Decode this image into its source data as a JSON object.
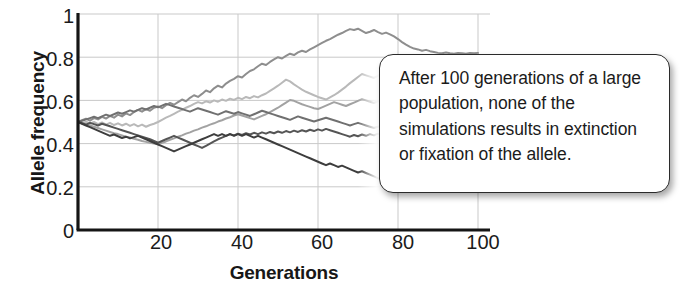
{
  "chart_data": {
    "type": "line",
    "title": "",
    "xlabel": "Generations",
    "ylabel": "Allele frequency",
    "xlim": [
      0,
      103
    ],
    "ylim": [
      0,
      1
    ],
    "xticks": [
      20,
      40,
      60,
      80,
      100
    ],
    "yticks": [
      0,
      0.2,
      0.4,
      0.6,
      0.8,
      1
    ],
    "ytick_labels": [
      "0",
      "0.2",
      "0.4",
      "0.6",
      "0.8",
      "1"
    ],
    "xtick_labels": [
      "20",
      "40",
      "60",
      "80",
      "100"
    ],
    "grid": true,
    "legend_position": "none",
    "annotation": "After 100 generations of a large population, none of the simulations results in extinction or fixation of the allele.",
    "x": [
      0,
      1,
      2,
      3,
      4,
      5,
      6,
      7,
      8,
      9,
      10,
      11,
      12,
      13,
      14,
      15,
      16,
      17,
      18,
      19,
      20,
      21,
      22,
      23,
      24,
      25,
      26,
      27,
      28,
      29,
      30,
      31,
      32,
      33,
      34,
      35,
      36,
      37,
      38,
      39,
      40,
      41,
      42,
      43,
      44,
      45,
      46,
      47,
      48,
      49,
      50,
      51,
      52,
      53,
      54,
      55,
      56,
      57,
      58,
      59,
      60,
      61,
      62,
      63,
      64,
      65,
      66,
      67,
      68,
      69,
      70,
      71,
      72,
      73,
      74,
      75,
      76,
      77,
      78,
      79,
      80,
      81,
      82,
      83,
      84,
      85,
      86,
      87,
      88,
      89,
      90,
      91,
      92,
      93,
      94,
      95,
      96,
      97,
      98,
      99,
      100
    ],
    "series": [
      {
        "name": "simulation-1",
        "color": "#8e8e8e",
        "final_value": 0.82,
        "values": [
          0.5,
          0.508,
          0.515,
          0.506,
          0.518,
          0.512,
          0.524,
          0.516,
          0.528,
          0.52,
          0.534,
          0.526,
          0.54,
          0.532,
          0.546,
          0.556,
          0.548,
          0.56,
          0.552,
          0.566,
          0.572,
          0.564,
          0.578,
          0.588,
          0.58,
          0.592,
          0.604,
          0.596,
          0.612,
          0.624,
          0.616,
          0.63,
          0.646,
          0.638,
          0.656,
          0.668,
          0.66,
          0.678,
          0.69,
          0.7,
          0.712,
          0.706,
          0.722,
          0.736,
          0.744,
          0.758,
          0.77,
          0.764,
          0.778,
          0.79,
          0.8,
          0.794,
          0.806,
          0.816,
          0.81,
          0.822,
          0.83,
          0.824,
          0.836,
          0.846,
          0.856,
          0.866,
          0.876,
          0.884,
          0.894,
          0.904,
          0.912,
          0.922,
          0.93,
          0.926,
          0.932,
          0.922,
          0.912,
          0.918,
          0.926,
          0.916,
          0.908,
          0.914,
          0.906,
          0.896,
          0.884,
          0.87,
          0.858,
          0.848,
          0.84,
          0.836,
          0.83,
          0.834,
          0.828,
          0.824,
          0.82,
          0.818,
          0.822,
          0.818,
          0.816,
          0.82,
          0.818,
          0.816,
          0.82,
          0.818,
          0.82
        ]
      },
      {
        "name": "simulation-2",
        "color": "#b9b9b9",
        "final_value": 0.66,
        "values": [
          0.5,
          0.494,
          0.502,
          0.492,
          0.5,
          0.49,
          0.498,
          0.488,
          0.496,
          0.486,
          0.494,
          0.484,
          0.492,
          0.482,
          0.49,
          0.48,
          0.488,
          0.478,
          0.486,
          0.492,
          0.5,
          0.51,
          0.52,
          0.528,
          0.538,
          0.548,
          0.556,
          0.566,
          0.574,
          0.584,
          0.592,
          0.586,
          0.596,
          0.59,
          0.6,
          0.594,
          0.604,
          0.598,
          0.608,
          0.602,
          0.612,
          0.606,
          0.616,
          0.61,
          0.62,
          0.614,
          0.624,
          0.632,
          0.644,
          0.656,
          0.668,
          0.682,
          0.696,
          0.688,
          0.674,
          0.662,
          0.65,
          0.64,
          0.632,
          0.624,
          0.616,
          0.61,
          0.604,
          0.614,
          0.624,
          0.636,
          0.65,
          0.664,
          0.68,
          0.694,
          0.708,
          0.722,
          0.716,
          0.71,
          0.704,
          0.714,
          0.726,
          0.714,
          0.7,
          0.69,
          0.68,
          0.672,
          0.664,
          0.656,
          0.65,
          0.644,
          0.652,
          0.646,
          0.64,
          0.648,
          0.642,
          0.65,
          0.644,
          0.652,
          0.646,
          0.654,
          0.648,
          0.656,
          0.65,
          0.658,
          0.66
        ]
      },
      {
        "name": "simulation-3",
        "color": "#a2a2a2",
        "final_value": 0.64,
        "values": [
          0.5,
          0.496,
          0.49,
          0.484,
          0.478,
          0.472,
          0.466,
          0.46,
          0.454,
          0.448,
          0.444,
          0.438,
          0.432,
          0.428,
          0.422,
          0.418,
          0.412,
          0.408,
          0.404,
          0.4,
          0.398,
          0.404,
          0.41,
          0.418,
          0.424,
          0.432,
          0.438,
          0.446,
          0.452,
          0.46,
          0.466,
          0.474,
          0.48,
          0.488,
          0.494,
          0.502,
          0.508,
          0.516,
          0.522,
          0.53,
          0.536,
          0.53,
          0.524,
          0.518,
          0.512,
          0.52,
          0.528,
          0.536,
          0.546,
          0.556,
          0.566,
          0.578,
          0.59,
          0.602,
          0.598,
          0.59,
          0.582,
          0.576,
          0.57,
          0.564,
          0.56,
          0.568,
          0.576,
          0.584,
          0.592,
          0.586,
          0.58,
          0.574,
          0.582,
          0.59,
          0.598,
          0.606,
          0.6,
          0.594,
          0.588,
          0.596,
          0.604,
          0.612,
          0.62,
          0.614,
          0.608,
          0.6,
          0.606,
          0.614,
          0.622,
          0.616,
          0.61,
          0.618,
          0.626,
          0.62,
          0.628,
          0.622,
          0.63,
          0.624,
          0.632,
          0.626,
          0.634,
          0.628,
          0.636,
          0.632,
          0.64
        ]
      },
      {
        "name": "simulation-4",
        "color": "#707070",
        "final_value": 0.47,
        "values": [
          0.5,
          0.506,
          0.512,
          0.518,
          0.524,
          0.518,
          0.526,
          0.534,
          0.528,
          0.536,
          0.544,
          0.538,
          0.546,
          0.554,
          0.548,
          0.556,
          0.564,
          0.558,
          0.566,
          0.574,
          0.568,
          0.576,
          0.584,
          0.578,
          0.572,
          0.566,
          0.56,
          0.554,
          0.548,
          0.556,
          0.564,
          0.558,
          0.552,
          0.546,
          0.54,
          0.534,
          0.542,
          0.55,
          0.544,
          0.538,
          0.546,
          0.54,
          0.534,
          0.528,
          0.536,
          0.544,
          0.552,
          0.546,
          0.54,
          0.534,
          0.528,
          0.522,
          0.516,
          0.51,
          0.518,
          0.526,
          0.52,
          0.514,
          0.508,
          0.502,
          0.508,
          0.514,
          0.52,
          0.514,
          0.508,
          0.502,
          0.496,
          0.49,
          0.484,
          0.49,
          0.496,
          0.49,
          0.484,
          0.478,
          0.472,
          0.478,
          0.484,
          0.478,
          0.472,
          0.466,
          0.472,
          0.466,
          0.472,
          0.468,
          0.474,
          0.47,
          0.466,
          0.472,
          0.468,
          0.474,
          0.47,
          0.466,
          0.472,
          0.468,
          0.474,
          0.47,
          0.466,
          0.472,
          0.468,
          0.47,
          0.47
        ]
      },
      {
        "name": "simulation-5",
        "color": "#555555",
        "final_value": 0.44,
        "values": [
          0.5,
          0.494,
          0.488,
          0.496,
          0.49,
          0.484,
          0.492,
          0.486,
          0.48,
          0.474,
          0.468,
          0.462,
          0.456,
          0.45,
          0.444,
          0.438,
          0.432,
          0.426,
          0.42,
          0.412,
          0.404,
          0.412,
          0.42,
          0.428,
          0.436,
          0.428,
          0.42,
          0.412,
          0.404,
          0.396,
          0.388,
          0.38,
          0.39,
          0.4,
          0.41,
          0.42,
          0.428,
          0.436,
          0.444,
          0.438,
          0.446,
          0.44,
          0.448,
          0.442,
          0.45,
          0.444,
          0.452,
          0.446,
          0.454,
          0.448,
          0.456,
          0.45,
          0.458,
          0.452,
          0.46,
          0.454,
          0.462,
          0.456,
          0.464,
          0.458,
          0.466,
          0.46,
          0.468,
          0.462,
          0.456,
          0.45,
          0.444,
          0.438,
          0.432,
          0.44,
          0.434,
          0.442,
          0.436,
          0.444,
          0.438,
          0.446,
          0.44,
          0.448,
          0.442,
          0.436,
          0.442,
          0.438,
          0.444,
          0.44,
          0.436,
          0.442,
          0.438,
          0.444,
          0.44,
          0.436,
          0.442,
          0.438,
          0.444,
          0.44,
          0.436,
          0.442,
          0.438,
          0.444,
          0.44,
          0.436,
          0.44
        ]
      },
      {
        "name": "simulation-6",
        "color": "#3d3d3d",
        "final_value": 0.2,
        "values": [
          0.5,
          0.492,
          0.484,
          0.476,
          0.468,
          0.46,
          0.452,
          0.444,
          0.436,
          0.442,
          0.434,
          0.426,
          0.432,
          0.424,
          0.43,
          0.436,
          0.428,
          0.42,
          0.412,
          0.404,
          0.396,
          0.388,
          0.38,
          0.372,
          0.364,
          0.372,
          0.38,
          0.388,
          0.396,
          0.404,
          0.412,
          0.42,
          0.428,
          0.436,
          0.444,
          0.436,
          0.444,
          0.436,
          0.444,
          0.436,
          0.444,
          0.436,
          0.444,
          0.436,
          0.428,
          0.436,
          0.428,
          0.42,
          0.412,
          0.404,
          0.396,
          0.388,
          0.38,
          0.372,
          0.364,
          0.356,
          0.348,
          0.34,
          0.332,
          0.324,
          0.316,
          0.308,
          0.3,
          0.308,
          0.3,
          0.292,
          0.298,
          0.29,
          0.282,
          0.274,
          0.266,
          0.272,
          0.264,
          0.256,
          0.248,
          0.24,
          0.232,
          0.224,
          0.216,
          0.208,
          0.2,
          0.206,
          0.2,
          0.204,
          0.198,
          0.202,
          0.198,
          0.204,
          0.198,
          0.202,
          0.198,
          0.204,
          0.198,
          0.202,
          0.198,
          0.204,
          0.198,
          0.202,
          0.198,
          0.202,
          0.2
        ]
      }
    ]
  },
  "axes": {
    "y_title": "Allele frequency",
    "x_title": "Generations"
  },
  "callout": {
    "text": "After 100 generations of a large population, none of the simulations results in extinction or fixation of the allele."
  },
  "colors": {
    "axis": "#151515",
    "grid": "#c9c9c9",
    "text": "#1b1b1b",
    "callout_border": "#2b2b2b",
    "callout_fill": "#ffffff"
  }
}
